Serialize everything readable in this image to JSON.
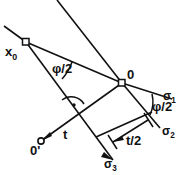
{
  "figure": {
    "background_color": "#ffffff",
    "stroke_color": "#111111",
    "labels": {
      "x0": "x",
      "x0_sub": "0",
      "origin": "0",
      "origin_prime": "0'",
      "phi_half_left": "φ/2",
      "phi_half_right": "φ/2",
      "sigma1": "σ",
      "sigma1_sub": "1",
      "sigma2": "σ",
      "sigma2_sub": "2",
      "sigma3": "σ",
      "sigma3_sub": "3",
      "t": "t",
      "t_half": "t/2"
    },
    "markers": {
      "x0_marker": "square-node",
      "origin_marker": "square-node",
      "origin_prime_marker": "circle-node",
      "right_angle_marker": "right-angle-dot"
    }
  }
}
